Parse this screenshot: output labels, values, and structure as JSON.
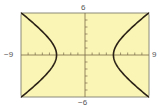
{
  "chart_data": {
    "type": "line",
    "title": "",
    "xlabel": "",
    "ylabel": "",
    "xlim": [
      -9,
      9
    ],
    "ylim": [
      -6,
      6
    ],
    "grid": false,
    "legend": null,
    "tick_labels": {
      "x_min": "−9",
      "x_max": "9",
      "y_min": "−6",
      "y_max": "6"
    },
    "x_ticks_step": 1,
    "y_ticks_step": 1,
    "series": [
      {
        "name": "hyperbola x^2/16 - y^2/9 = 1 (right branch)",
        "x": [
          9.0,
          7.6,
          6.5,
          5.6,
          5.0,
          4.5,
          4.1,
          4.0,
          4.1,
          4.5,
          5.0,
          5.6,
          6.5,
          7.6,
          9.0
        ],
        "y": [
          6.0,
          4.9,
          3.8,
          3.0,
          2.25,
          1.5,
          0.7,
          0,
          -0.7,
          -1.5,
          -2.25,
          -3.0,
          -3.8,
          -4.9,
          -6.0
        ]
      },
      {
        "name": "hyperbola x^2/16 - y^2/9 = 1 (left branch)",
        "x": [
          -9.0,
          -7.6,
          -6.5,
          -5.6,
          -5.0,
          -4.5,
          -4.1,
          -4.0,
          -4.1,
          -4.5,
          -5.0,
          -5.6,
          -6.5,
          -7.6,
          -9.0
        ],
        "y": [
          6.0,
          4.9,
          3.8,
          3.0,
          2.25,
          1.5,
          0.7,
          0,
          -0.7,
          -1.5,
          -2.25,
          -3.0,
          -3.8,
          -4.9,
          -6.0
        ]
      }
    ],
    "equation": "x^2/16 - y^2/9 = 1",
    "colors": {
      "background": "#faf5b4",
      "frame": "#8a8a7a",
      "curve": "#2b2116",
      "axis": "#7a6a4a"
    }
  }
}
